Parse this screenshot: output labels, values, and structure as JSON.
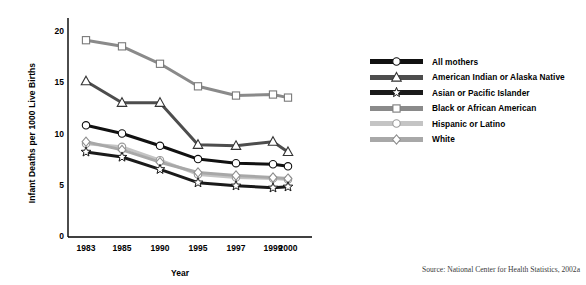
{
  "chart_data": {
    "type": "line",
    "title": "",
    "xlabel": "Year",
    "ylabel": "Infant Deaths per 1000 Live Births",
    "categories": [
      "1983",
      "1985",
      "1990",
      "1995",
      "1997",
      "1999",
      "2000"
    ],
    "ylim": [
      0,
      21
    ],
    "yticks": [
      0,
      5,
      10,
      15,
      20
    ],
    "ytick_labels": [
      "0",
      "5",
      "10",
      "15",
      "20"
    ],
    "grid": false,
    "legend_position": "right",
    "series": [
      {
        "name": "All mothers",
        "marker": "circle",
        "line_color": "#111111",
        "marker_fill": "#ffffff",
        "marker_edge": "#111111",
        "values": [
          10.9,
          10.1,
          8.9,
          7.6,
          7.2,
          7.1,
          6.9
        ]
      },
      {
        "name": "American Indian or Alaska Native",
        "marker": "triangle",
        "line_color": "#4d4d4d",
        "marker_fill": "#ffffff",
        "marker_edge": "#333333",
        "values": [
          15.2,
          13.1,
          13.1,
          9.0,
          8.9,
          9.3,
          8.3
        ]
      },
      {
        "name": "Asian or Pacific Islander",
        "marker": "star",
        "line_color": "#1a1a1a",
        "marker_fill": "#ffffff",
        "marker_edge": "#1a1a1a",
        "values": [
          8.3,
          7.8,
          6.6,
          5.3,
          5.0,
          4.8,
          4.9
        ]
      },
      {
        "name": "Black or African American",
        "marker": "square",
        "line_color": "#8a8a8a",
        "marker_fill": "#ffffff",
        "marker_edge": "#7a7a7a",
        "values": [
          19.2,
          18.6,
          16.9,
          14.7,
          13.8,
          13.9,
          13.6
        ]
      },
      {
        "name": "Hispanic or Latino",
        "marker": "circle",
        "line_color": "#c4c4c4",
        "marker_fill": "#ffffff",
        "marker_edge": "#9a9a9a",
        "values": [
          9.1,
          8.8,
          7.5,
          6.1,
          5.8,
          5.7,
          5.6
        ]
      },
      {
        "name": "White",
        "marker": "diamond",
        "line_color": "#a8a8a8",
        "marker_fill": "#ffffff",
        "marker_edge": "#8f8f8f",
        "values": [
          9.3,
          8.5,
          7.3,
          6.3,
          6.0,
          5.8,
          5.7
        ]
      }
    ]
  },
  "legend": {
    "items": [
      {
        "label": "All mothers"
      },
      {
        "label": "American Indian or Alaska Native"
      },
      {
        "label": "Asian or Pacific Islander"
      },
      {
        "label": "Black or African American"
      },
      {
        "label": "Hispanic or Latino"
      },
      {
        "label": "White"
      }
    ]
  },
  "source": {
    "text": "Source: National Center for Health Statistics, 2002a"
  }
}
